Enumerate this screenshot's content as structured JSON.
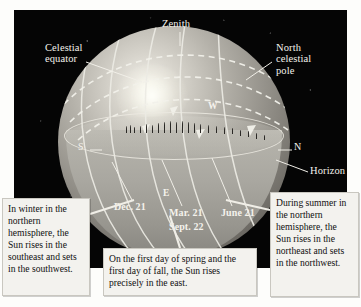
{
  "figure": {
    "panel_background": "#050505",
    "labels": {
      "zenith": "Zenith",
      "celestial_equator": "Celestial\nequator",
      "north_celestial_pole": "North\ncelestial\npole",
      "horizon": "Horizon",
      "south": "S",
      "north": "N",
      "west": "W",
      "east": "E"
    },
    "sun_path_dates": {
      "december": "Dec. 21",
      "march": "Mar. 21",
      "september": "Sept. 22",
      "june": "June 21"
    }
  },
  "captions": {
    "winter": "In winter in the northern hemisphere, the Sun rises in the southeast and sets in the southwest.",
    "equinox": "On the first day of spring and the first day of fall, the Sun rises precisely in the east.",
    "summer": "During summer in the northern hemisphere, the Sun rises in the northeast and sets in the northwest."
  },
  "colors": {
    "sky": "#050505",
    "sphere_highlight": "#f2f0ea",
    "sphere_shadow": "#56534e",
    "line": "#ecebe4",
    "caption_bg": "#f3f2ee",
    "page_bg": "#fdfdfb"
  }
}
